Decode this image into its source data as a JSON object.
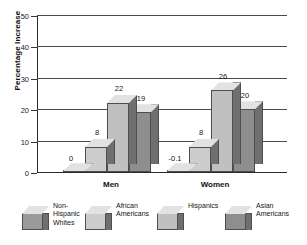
{
  "chart_data": {
    "type": "bar",
    "title": "",
    "subtitle": "",
    "xlabel": "",
    "ylabel": "Percentage Increase",
    "categories": [
      "Men",
      "Women"
    ],
    "ylim": [
      0,
      50
    ],
    "yticks": [
      0,
      10,
      20,
      30,
      40,
      50
    ],
    "ytick_labels": [
      "0",
      "10",
      "20",
      "30",
      "40",
      "50"
    ],
    "grid": true,
    "legend_position": "bottom",
    "style": "3d-bar",
    "series": [
      {
        "name": "Non-Hispanic Whites",
        "legend_label": "Non-\nHispanic\nWhites",
        "color": "#9a9a9a",
        "values": [
          0,
          -0.1
        ],
        "labels": [
          "0",
          "-0.1"
        ]
      },
      {
        "name": "African Americans",
        "legend_label": "African\nAmericans",
        "color": "#cdcdcd",
        "values": [
          8,
          8
        ],
        "labels": [
          "8",
          "8"
        ]
      },
      {
        "name": "Hispanics",
        "legend_label": "Hispanics",
        "color": "#c0c0c0",
        "values": [
          22,
          26
        ],
        "labels": [
          "22",
          "26"
        ]
      },
      {
        "name": "Asian Americans",
        "legend_label": "Asian\nAmericans",
        "color": "#8e8e8e",
        "values": [
          19,
          20
        ],
        "labels": [
          "19",
          "20"
        ]
      }
    ]
  },
  "axis": {
    "ylabel": "Percentage Increase",
    "ticks": [
      {
        "label": "50",
        "value": 50
      },
      {
        "label": "40",
        "value": 40
      },
      {
        "label": "30",
        "value": 30
      },
      {
        "label": "20",
        "value": 20
      },
      {
        "label": "10",
        "value": 10
      },
      {
        "label": "0",
        "value": 0
      }
    ]
  },
  "groups": [
    {
      "label": "Men"
    },
    {
      "label": "Women"
    }
  ],
  "legend": {
    "items": [
      {
        "label": "Non-\nHispanic\nWhites"
      },
      {
        "label": "African\nAmericans"
      },
      {
        "label": "Hispanics"
      },
      {
        "label": "Asian\nAmericans"
      }
    ]
  }
}
